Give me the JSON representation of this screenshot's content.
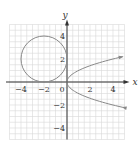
{
  "chart_data": {
    "type": "line",
    "title": "",
    "xlabel": "x",
    "ylabel": "y",
    "xlim": [
      -5,
      5
    ],
    "ylim": [
      -5,
      5
    ],
    "grid": true,
    "x_ticks": [
      -4,
      -2,
      0,
      2,
      4
    ],
    "y_ticks": [
      4,
      2,
      -2,
      -4
    ],
    "x_tick_labels": [
      "−4",
      "−2",
      "0",
      "2",
      "4"
    ],
    "y_tick_labels": [
      "4",
      "2",
      "−2",
      "−4"
    ],
    "series": [
      {
        "name": "circle",
        "kind": "circle",
        "center": [
          -2,
          2
        ],
        "radius": 2,
        "color": "#888888"
      },
      {
        "name": "parabola",
        "kind": "parametric",
        "equation": "x = y^2",
        "y_range": [
          -2.2,
          2.2
        ],
        "arrows": true,
        "color": "#888888"
      }
    ]
  },
  "colors": {
    "grid": "#d8d8d8",
    "axis": "#333333",
    "curve": "#888888"
  }
}
